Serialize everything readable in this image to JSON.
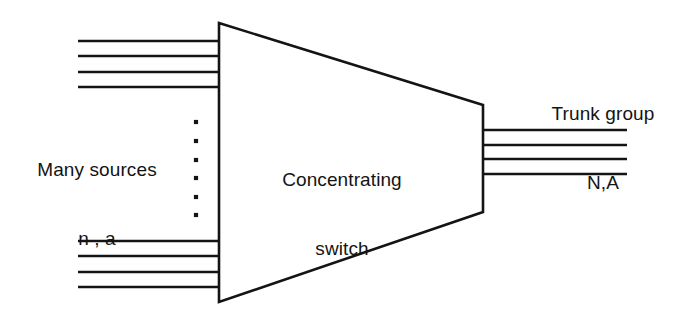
{
  "figure": {
    "background_color": "#ffffff",
    "stroke_color": "#141414",
    "text_color": "#141414",
    "width": 687,
    "height": 318
  },
  "labels": {
    "left": {
      "line1": "Many sources",
      "line2": "n , a"
    },
    "center": {
      "line1": "Concentrating",
      "line2": "switch"
    },
    "right": {
      "line1": "Trunk group",
      "line2": "N,A"
    }
  },
  "shape": {
    "name": "trapezoid",
    "points": "219,23 483,105 483,212 219,302",
    "stroke_width": 2.6
  },
  "input_lines_top": [
    {
      "x1": 78,
      "y1": 41,
      "x2": 219,
      "y2": 41
    },
    {
      "x1": 78,
      "y1": 56,
      "x2": 219,
      "y2": 56
    },
    {
      "x1": 78,
      "y1": 72,
      "x2": 219,
      "y2": 72
    },
    {
      "x1": 78,
      "y1": 87,
      "x2": 219,
      "y2": 87
    }
  ],
  "input_lines_bottom": [
    {
      "x1": 78,
      "y1": 241,
      "x2": 219,
      "y2": 241
    },
    {
      "x1": 78,
      "y1": 256,
      "x2": 219,
      "y2": 256
    },
    {
      "x1": 78,
      "y1": 272,
      "x2": 219,
      "y2": 272
    },
    {
      "x1": 78,
      "y1": 287,
      "x2": 219,
      "y2": 287
    }
  ],
  "output_lines": [
    {
      "x1": 483,
      "y1": 130,
      "x2": 627,
      "y2": 130
    },
    {
      "x1": 483,
      "y1": 145,
      "x2": 627,
      "y2": 145
    },
    {
      "x1": 483,
      "y1": 159,
      "x2": 627,
      "y2": 159
    },
    {
      "x1": 483,
      "y1": 174,
      "x2": 627,
      "y2": 174
    }
  ],
  "ellipsis_dots": [
    {
      "cx": 196,
      "cy": 122,
      "r": 2.1
    },
    {
      "cx": 196,
      "cy": 141,
      "r": 2.1
    },
    {
      "cx": 196,
      "cy": 160,
      "r": 2.1
    },
    {
      "cx": 196,
      "cy": 178,
      "r": 2.1
    },
    {
      "cx": 196,
      "cy": 197,
      "r": 2.1
    },
    {
      "cx": 196,
      "cy": 215,
      "r": 2.1
    }
  ]
}
